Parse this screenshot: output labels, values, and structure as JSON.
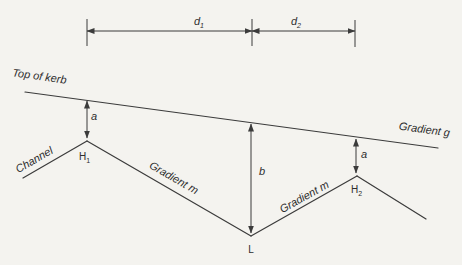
{
  "diagram": {
    "dimensions": {
      "d1": {
        "main": "d",
        "sub": "1"
      },
      "d2": {
        "main": "d",
        "sub": "2"
      }
    },
    "measurements": {
      "a_left": "a",
      "b": "b",
      "a_right": "a"
    },
    "points": {
      "h1": {
        "main": "H",
        "sub": "1"
      },
      "h2": {
        "main": "H",
        "sub": "2"
      },
      "l": "L"
    },
    "line_labels": {
      "top_of_kerb": "Top of kerb",
      "gradient_g": "Gradient g",
      "channel": "Channel",
      "gradient_m_left": "Gradient m",
      "gradient_m_right": "Gradient m"
    },
    "colors": {
      "background": "#f4f3ef",
      "line": "#3b3b3b",
      "text": "#2e2e2e"
    }
  }
}
